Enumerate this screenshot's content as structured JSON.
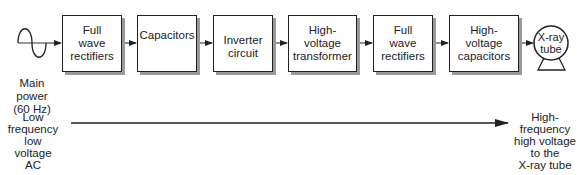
{
  "diagram": {
    "source": {
      "label_lines": [
        "Main",
        "power",
        "(60 Hz)"
      ],
      "icon": "sine-wave-icon"
    },
    "blocks": [
      {
        "lines": [
          "Full",
          "wave",
          "rectifiers"
        ]
      },
      {
        "lines": [
          "Capacitors"
        ]
      },
      {
        "lines": [
          "Inverter",
          "circuit"
        ]
      },
      {
        "lines": [
          "High-",
          "voltage",
          "transformer"
        ]
      },
      {
        "lines": [
          "Full",
          "wave",
          "rectifiers"
        ]
      },
      {
        "lines": [
          "High-",
          "voltage",
          "capacitors"
        ]
      }
    ],
    "sink": {
      "lines": [
        "X-ray",
        "tube"
      ],
      "icon": "x-ray-tube-icon"
    },
    "bottom": {
      "left_lines": [
        "Low",
        "frequency",
        "low",
        "voltage",
        "AC"
      ],
      "right_lines": [
        "High-",
        "frequency",
        "high voltage",
        "to the",
        "X-ray tube"
      ]
    }
  }
}
